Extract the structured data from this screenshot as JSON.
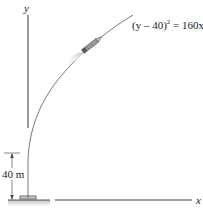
{
  "diagram": {
    "axes": {
      "y_label": "y",
      "x_label": "x"
    },
    "curve": {
      "equation_prefix": "(y – 40)",
      "equation_exponent": "2",
      "equation_suffix": " = 160x"
    },
    "dimension": {
      "label": "40 m"
    },
    "objects": [
      "rocket",
      "launch-pad",
      "ground"
    ]
  }
}
